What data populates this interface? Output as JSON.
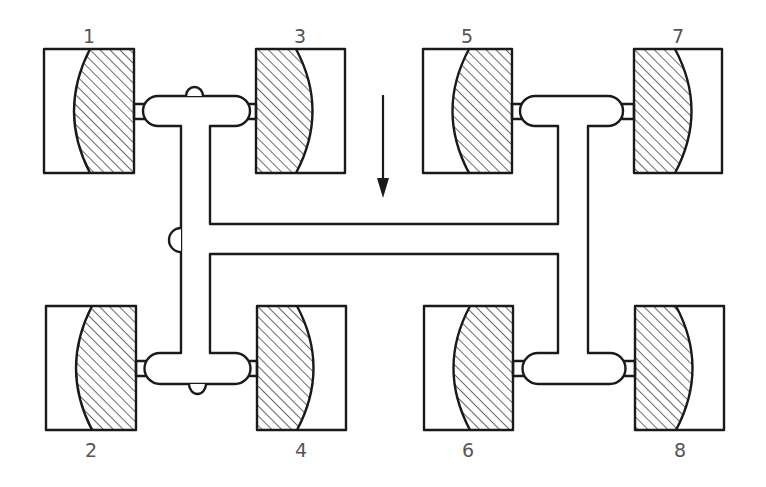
{
  "diagram": {
    "title": "",
    "direction_arrow": "down",
    "colors": {
      "stroke": "#1a1a1a",
      "label": "#555555",
      "background": "#ffffff"
    },
    "wheels": [
      {
        "id": "1",
        "label": "1",
        "x": 44,
        "y": 49,
        "w": 90,
        "h": 124,
        "hatch_side": "right",
        "label_pos": "top"
      },
      {
        "id": "3",
        "label": "3",
        "x": 256,
        "y": 49,
        "w": 89,
        "h": 124,
        "hatch_side": "left",
        "label_pos": "top"
      },
      {
        "id": "5",
        "label": "5",
        "x": 423,
        "y": 49,
        "w": 89,
        "h": 124,
        "hatch_side": "right",
        "label_pos": "top"
      },
      {
        "id": "7",
        "label": "7",
        "x": 634,
        "y": 49,
        "w": 88,
        "h": 124,
        "hatch_side": "left",
        "label_pos": "top"
      },
      {
        "id": "2",
        "label": "2",
        "x": 46,
        "y": 306,
        "w": 90,
        "h": 124,
        "hatch_side": "right",
        "label_pos": "bottom"
      },
      {
        "id": "4",
        "label": "4",
        "x": 257,
        "y": 306,
        "w": 89,
        "h": 124,
        "hatch_side": "left",
        "label_pos": "bottom"
      },
      {
        "id": "6",
        "label": "6",
        "x": 424,
        "y": 306,
        "w": 89,
        "h": 124,
        "hatch_side": "right",
        "label_pos": "bottom"
      },
      {
        "id": "8",
        "label": "8",
        "x": 635,
        "y": 306,
        "w": 89,
        "h": 124,
        "hatch_side": "left",
        "label_pos": "bottom"
      }
    ],
    "labels": [
      {
        "text": "1",
        "x": 89,
        "y": 36
      },
      {
        "text": "3",
        "x": 300,
        "y": 36
      },
      {
        "text": "5",
        "x": 467,
        "y": 36
      },
      {
        "text": "7",
        "x": 678,
        "y": 36
      },
      {
        "text": "2",
        "x": 91,
        "y": 450
      },
      {
        "text": "4",
        "x": 301,
        "y": 450
      },
      {
        "text": "6",
        "x": 468,
        "y": 450
      },
      {
        "text": "8",
        "x": 680,
        "y": 450
      }
    ]
  }
}
